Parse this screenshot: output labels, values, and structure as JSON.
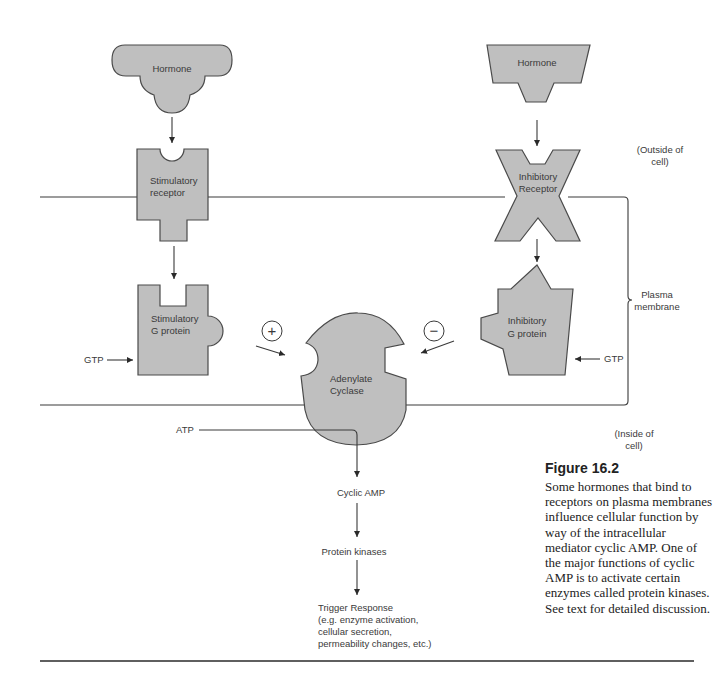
{
  "figure": {
    "title": "Figure 16.2",
    "caption": "Some hormones that bind to receptors on plasma membranes influence cellular function by way of the intracellular mediator cyclic AMP. One of the major functions of cyclic AMP is to activate certain enzymes called protein kinases. See text for detailed discussion."
  },
  "regions": {
    "outside": [
      "(Outside of",
      "cell)"
    ],
    "membrane": [
      "Plasma",
      "membrane"
    ],
    "inside": [
      "(Inside of",
      "cell)"
    ]
  },
  "stimulatory_path": {
    "hormone": "Hormone",
    "receptor": [
      "Stimulatory",
      "receptor"
    ],
    "g_protein": [
      "Stimulatory",
      "G protein"
    ],
    "gtp": "GTP",
    "sign": "+"
  },
  "inhibitory_path": {
    "hormone": "Hormone",
    "receptor": [
      "Inhibitory",
      "Receptor"
    ],
    "g_protein": [
      "Inhibitory",
      "G protein"
    ],
    "gtp": "GTP",
    "sign": "−"
  },
  "enzyme": [
    "Adenylate",
    "Cyclase"
  ],
  "cascade": {
    "substrate": "ATP",
    "second_messenger": "Cyclic AMP",
    "kinases": "Protein kinases",
    "response": [
      "Trigger Response",
      "(e.g. enzyme activation,",
      "cellular secretion,",
      "permeability changes, etc.)"
    ]
  }
}
